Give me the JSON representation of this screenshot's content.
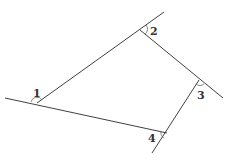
{
  "diagram": {
    "vertices": [
      {
        "id": "A",
        "x": 37,
        "y": 103
      },
      {
        "id": "B",
        "x": 140,
        "y": 30
      },
      {
        "id": "C",
        "x": 199,
        "y": 80
      },
      {
        "id": "D",
        "x": 167,
        "y": 133
      }
    ],
    "angle_labels": [
      {
        "text": "1",
        "x": 33,
        "y": 97
      },
      {
        "text": "2",
        "x": 150,
        "y": 35
      },
      {
        "text": "3",
        "x": 197,
        "y": 99
      },
      {
        "text": "4",
        "x": 148,
        "y": 142
      }
    ]
  }
}
